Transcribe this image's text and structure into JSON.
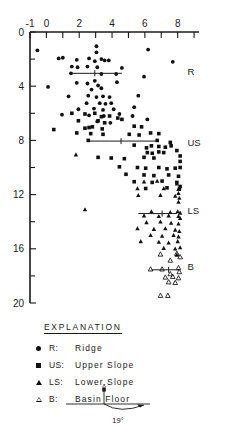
{
  "chart_data": {
    "type": "scatter",
    "title": "",
    "xlabel": "",
    "ylabel": "",
    "xlim": [
      -1,
      9.3
    ],
    "ylim": [
      0,
      20
    ],
    "y_inverted": true,
    "grid": false,
    "x_axis_position": "top",
    "x_ticks_major": [
      -1,
      0,
      2,
      4,
      6,
      8
    ],
    "x_ticks_minor": [
      1,
      3,
      5,
      7,
      9
    ],
    "x_ticklabels": [
      "-1",
      "0",
      "2",
      "4",
      "6",
      "8"
    ],
    "y_ticks_major": [
      0,
      4,
      8,
      12,
      16,
      20
    ],
    "y_ticks_minor": [
      2,
      6,
      10,
      14,
      18
    ],
    "y_ticklabels": [
      "0",
      "4",
      "8",
      "12",
      "16",
      "20"
    ],
    "group_labels": [
      {
        "text": "R",
        "x": 8.6,
        "y": 3.2
      },
      {
        "text": "US",
        "x": 8.6,
        "y": 8.4
      },
      {
        "text": "LS",
        "x": 8.6,
        "y": 13.4
      },
      {
        "text": "B",
        "x": 8.6,
        "y": 17.6
      }
    ],
    "mean_lines": [
      {
        "series": "Ridge",
        "y": 3.05,
        "x_start": 1.45,
        "x_end": 4.6,
        "mean_x": 2.95
      },
      {
        "series": "Upper Slope",
        "y": 8.05,
        "x_start": 2.55,
        "x_end": 6.75,
        "mean_x": 4.55
      },
      {
        "series": "Lower Slope",
        "y": 13.4,
        "x_start": 5.6,
        "x_end": 7.95,
        "mean_x": 7.05
      },
      {
        "series": "Basin Floor",
        "y": 17.55,
        "x_start": 6.4,
        "x_end": 8.1,
        "mean_x": 7.45
      }
    ],
    "series": [
      {
        "name": "Ridge",
        "code": "R",
        "marker": "filled-circle",
        "color": "#111111",
        "points": [
          [
            -0.55,
            1.35
          ],
          [
            0.75,
            1.95
          ],
          [
            1.0,
            1.9
          ],
          [
            1.85,
            2.05
          ],
          [
            2.6,
            1.95
          ],
          [
            3.05,
            1.05
          ],
          [
            3.05,
            1.5
          ],
          [
            3.35,
            2.0
          ],
          [
            3.55,
            2.1
          ],
          [
            3.8,
            2.1
          ],
          [
            2.95,
            2.15
          ],
          [
            6.2,
            1.3
          ],
          [
            1.55,
            2.55
          ],
          [
            1.9,
            2.6
          ],
          [
            2.5,
            2.55
          ],
          [
            3.1,
            2.6
          ],
          [
            4.6,
            2.65
          ],
          [
            7.7,
            2.2
          ],
          [
            1.5,
            3.05
          ],
          [
            3.35,
            3.1
          ],
          [
            4.25,
            3.1
          ],
          [
            5.95,
            3.3
          ],
          [
            0.1,
            4.05
          ],
          [
            1.85,
            3.75
          ],
          [
            2.5,
            3.8
          ],
          [
            2.95,
            3.6
          ],
          [
            3.15,
            3.95
          ],
          [
            3.35,
            4.15
          ],
          [
            4.3,
            3.7
          ],
          [
            2.75,
            4.25
          ],
          [
            1.35,
            4.75
          ],
          [
            2.55,
            4.7
          ],
          [
            3.05,
            4.8
          ],
          [
            3.45,
            4.75
          ],
          [
            3.85,
            4.8
          ],
          [
            5.6,
            4.7
          ],
          [
            2.45,
            5.25
          ],
          [
            3.25,
            5.25
          ],
          [
            3.6,
            5.3
          ],
          [
            3.95,
            5.25
          ],
          [
            1.95,
            5.7
          ],
          [
            2.9,
            5.65
          ],
          [
            3.45,
            5.75
          ],
          [
            4.1,
            5.7
          ],
          [
            5.35,
            5.55
          ],
          [
            0.95,
            6.1
          ],
          [
            2.6,
            6.15
          ],
          [
            3.5,
            6.2
          ],
          [
            4.45,
            6.05
          ],
          [
            5.25,
            6.2
          ],
          [
            3.1,
            6.6
          ],
          [
            3.9,
            6.7
          ],
          [
            6.15,
            6.45
          ]
        ]
      },
      {
        "name": "Upper Slope",
        "code": "US",
        "marker": "filled-square",
        "color": "#111111",
        "points": [
          [
            1.55,
            6.0
          ],
          [
            2.35,
            6.05
          ],
          [
            2.95,
            6.0
          ],
          [
            3.35,
            6.25
          ],
          [
            3.85,
            6.2
          ],
          [
            4.35,
            6.35
          ],
          [
            1.95,
            6.55
          ],
          [
            3.15,
            6.55
          ],
          [
            3.55,
            6.7
          ],
          [
            4.6,
            6.45
          ],
          [
            0.45,
            7.2
          ],
          [
            2.35,
            7.1
          ],
          [
            2.6,
            7.05
          ],
          [
            2.8,
            7.0
          ],
          [
            3.4,
            7.15
          ],
          [
            5.35,
            6.95
          ],
          [
            5.8,
            7.0
          ],
          [
            1.85,
            7.45
          ],
          [
            2.7,
            7.5
          ],
          [
            3.45,
            7.55
          ],
          [
            5.05,
            7.55
          ],
          [
            5.65,
            7.6
          ],
          [
            6.35,
            7.45
          ],
          [
            6.85,
            7.5
          ],
          [
            2.55,
            8.0
          ],
          [
            6.75,
            8.0
          ],
          [
            7.55,
            8.15
          ],
          [
            5.35,
            8.35
          ],
          [
            6.1,
            8.55
          ],
          [
            6.4,
            8.4
          ],
          [
            6.85,
            8.45
          ],
          [
            7.25,
            8.5
          ],
          [
            7.6,
            8.4
          ],
          [
            6.15,
            8.9
          ],
          [
            6.45,
            8.95
          ],
          [
            6.85,
            8.85
          ],
          [
            7.15,
            8.9
          ],
          [
            7.95,
            8.75
          ],
          [
            3.15,
            9.25
          ],
          [
            3.95,
            9.3
          ],
          [
            4.75,
            9.35
          ],
          [
            5.95,
            9.25
          ],
          [
            6.55,
            9.3
          ],
          [
            8.15,
            9.15
          ],
          [
            8.15,
            9.55
          ],
          [
            4.45,
            9.95
          ],
          [
            5.55,
            10.0
          ],
          [
            6.05,
            10.05
          ],
          [
            6.85,
            10.0
          ],
          [
            7.35,
            10.1
          ],
          [
            7.85,
            10.05
          ],
          [
            8.15,
            10.0
          ],
          [
            4.85,
            10.5
          ],
          [
            5.95,
            10.55
          ],
          [
            6.55,
            10.6
          ],
          [
            7.45,
            10.55
          ],
          [
            8.05,
            10.65
          ],
          [
            5.35,
            11.05
          ],
          [
            6.45,
            11.1
          ],
          [
            7.05,
            11.0
          ],
          [
            7.95,
            11.1
          ],
          [
            8.15,
            11.4
          ],
          [
            6.05,
            11.55
          ],
          [
            7.35,
            11.5
          ],
          [
            8.1,
            11.6
          ]
        ]
      },
      {
        "name": "Lower Slope",
        "code": "LS",
        "marker": "filled-triangle",
        "color": "#111111",
        "points": [
          [
            1.8,
            9.05
          ],
          [
            5.95,
            11.05
          ],
          [
            6.75,
            11.0
          ],
          [
            7.95,
            11.2
          ],
          [
            5.55,
            11.55
          ],
          [
            7.15,
            11.55
          ],
          [
            8.05,
            11.6
          ],
          [
            8.05,
            11.9
          ],
          [
            5.6,
            12.05
          ],
          [
            6.95,
            12.05
          ],
          [
            7.85,
            12.1
          ],
          [
            8.1,
            12.25
          ],
          [
            8.05,
            12.55
          ],
          [
            2.35,
            13.1
          ],
          [
            6.4,
            13.25
          ],
          [
            7.55,
            13.3
          ],
          [
            8.0,
            13.25
          ],
          [
            8.15,
            13.35
          ],
          [
            5.95,
            13.55
          ],
          [
            6.85,
            13.6
          ],
          [
            7.45,
            13.55
          ],
          [
            8.05,
            13.6
          ],
          [
            8.15,
            13.75
          ],
          [
            6.1,
            14.05
          ],
          [
            6.95,
            14.0
          ],
          [
            7.6,
            14.1
          ],
          [
            8.05,
            14.15
          ],
          [
            5.55,
            14.5
          ],
          [
            6.55,
            14.55
          ],
          [
            7.25,
            14.5
          ],
          [
            7.85,
            14.6
          ],
          [
            8.1,
            14.7
          ],
          [
            6.35,
            15.0
          ],
          [
            7.05,
            15.05
          ],
          [
            7.75,
            15.0
          ],
          [
            8.05,
            15.1
          ],
          [
            5.75,
            15.45
          ],
          [
            6.85,
            15.5
          ],
          [
            7.45,
            15.55
          ],
          [
            8.0,
            15.45
          ],
          [
            7.15,
            15.95
          ],
          [
            7.85,
            16.0
          ],
          [
            8.15,
            15.9
          ],
          [
            7.95,
            16.45
          ]
        ]
      },
      {
        "name": "Basin Floor",
        "code": "B",
        "marker": "open-triangle",
        "color": "#111111",
        "points": [
          [
            6.95,
            16.4
          ],
          [
            7.95,
            16.35
          ],
          [
            8.15,
            16.6
          ],
          [
            7.55,
            16.85
          ],
          [
            6.35,
            17.5
          ],
          [
            7.05,
            17.5
          ],
          [
            8.05,
            17.4
          ],
          [
            8.1,
            17.7
          ],
          [
            7.55,
            17.85
          ],
          [
            7.25,
            18.1
          ],
          [
            7.7,
            18.05
          ],
          [
            8.05,
            18.15
          ],
          [
            7.45,
            18.45
          ],
          [
            7.85,
            18.5
          ],
          [
            6.95,
            19.45
          ],
          [
            7.4,
            19.45
          ]
        ]
      }
    ]
  },
  "legend": {
    "title": "EXPLANATION",
    "entries": [
      {
        "symbol": "filled-circle",
        "code": "R:",
        "label": "Ridge"
      },
      {
        "symbol": "filled-square",
        "code": "US:",
        "label": "Upper Slope"
      },
      {
        "symbol": "filled-triangle",
        "code": "LS:",
        "label": "Lower Slope"
      },
      {
        "symbol": "open-triangle",
        "code": "B:",
        "label": "Basin Floor"
      }
    ],
    "angle_figure": {
      "top_label": "x",
      "angle_label": "19°"
    }
  }
}
